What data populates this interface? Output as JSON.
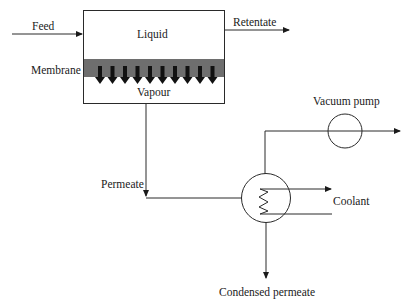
{
  "diagram": {
    "labels": {
      "feed": "Feed",
      "liquid": "Liquid",
      "retentate": "Retentate",
      "membrane": "Membrane",
      "vapour": "Vapour",
      "vacuum_pump": "Vacuum pump",
      "permeate": "Permeate",
      "coolant": "Coolant",
      "condensed_permeate": "Condensed permeate"
    },
    "membrane_arrow_count": 10,
    "colors": {
      "line": "#2a2a2a",
      "membrane": "#6e6e6e",
      "arrow": "#111111"
    }
  }
}
